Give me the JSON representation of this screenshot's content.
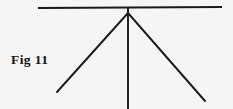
{
  "figure": {
    "caption": "Fig 11",
    "background_color": "#f6f5f3",
    "stroke_color": "#1a1a1a",
    "canvas": {
      "width": 233,
      "height": 109
    },
    "strokes": [
      {
        "name": "horizontal-ground-line",
        "type": "line",
        "x1": 38,
        "y1": 8,
        "x2": 222,
        "y2": 7,
        "width": 2.2
      },
      {
        "name": "vertical-mast-line",
        "type": "line",
        "x1": 128,
        "y1": 8,
        "x2": 128,
        "y2": 109,
        "width": 1.9
      },
      {
        "name": "left-diagonal-line",
        "type": "line",
        "x1": 128,
        "y1": 13,
        "x2": 57,
        "y2": 92,
        "width": 1.9
      },
      {
        "name": "right-diagonal-line",
        "type": "line",
        "x1": 128,
        "y1": 13,
        "x2": 205,
        "y2": 101,
        "width": 1.9
      }
    ]
  }
}
